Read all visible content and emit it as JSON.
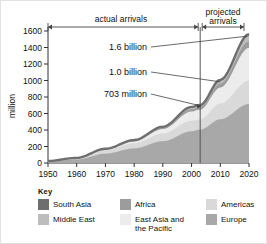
{
  "chart_data": {
    "type": "area",
    "title": "",
    "xlabel": "",
    "ylabel": "million",
    "xlim": [
      1950,
      2020
    ],
    "ylim": [
      0,
      1600
    ],
    "grid": false,
    "legend_position": "bottom",
    "xticks": [
      "1950",
      "1960",
      "1970",
      "1980",
      "1990",
      "2000",
      "2010",
      "2020"
    ],
    "yticks": [
      "0",
      "200",
      "400",
      "600",
      "800",
      "1000",
      "1200",
      "1400",
      "1600"
    ],
    "x": [
      1950,
      1960,
      1970,
      1980,
      1990,
      2000,
      2003,
      2010,
      2020
    ],
    "stacked": true,
    "series": [
      {
        "name": "Europe",
        "color": "#a8a8a8",
        "values": [
          17,
          42,
          113,
          178,
          264,
          385,
          405,
          530,
          717
        ]
      },
      {
        "name": "Americas",
        "color": "#d9d9d9",
        "values": [
          7,
          17,
          43,
          62,
          93,
          128,
          122,
          190,
          282
        ]
      },
      {
        "name": "East Asia and the Pacific",
        "color": "#ececec",
        "values": [
          0.2,
          1,
          6,
          21,
          55,
          111,
          120,
          195,
          397
        ]
      },
      {
        "name": "Africa",
        "color": "#9c9c9c",
        "values": [
          0.5,
          1,
          5,
          8,
          15,
          27,
          30,
          47,
          77
        ]
      },
      {
        "name": "Middle East",
        "color": "#bdbdbd",
        "values": [
          0.2,
          1,
          4,
          7,
          10,
          23,
          24,
          36,
          69
        ]
      },
      {
        "name": "South Asia",
        "color": "#6e6e6e",
        "values": [
          0.2,
          0.5,
          1,
          2,
          3,
          6,
          2,
          10,
          19
        ]
      }
    ],
    "totals": [
      25,
      62,
      172,
      278,
      440,
      680,
      703,
      1008,
      1561
    ],
    "annotations": [
      {
        "id": "a1",
        "label": "1.6 billion",
        "year": 2020,
        "value": 1561
      },
      {
        "id": "a2",
        "label": "1.0 billion",
        "year": 2010,
        "value": 1008
      },
      {
        "id": "a3",
        "label": "703 million",
        "year": 2003,
        "value": 703
      }
    ],
    "spans": [
      {
        "id": "s1",
        "label": "actual arrivals",
        "from": 1950,
        "to": 2003
      },
      {
        "id": "s2",
        "label": "projected arrivals",
        "from": 2003,
        "to": 2020
      }
    ],
    "divider_year": 2003
  },
  "legend": {
    "title": "Key",
    "items": [
      {
        "label": "South Asia",
        "color": "#6e6e6e"
      },
      {
        "label": "Africa",
        "color": "#9c9c9c"
      },
      {
        "label": "Americas",
        "color": "#d9d9d9"
      },
      {
        "label": "Middle East",
        "color": "#bdbdbd"
      },
      {
        "label": "East Asia and\nthe Pacific",
        "color": "#ececec"
      },
      {
        "label": "Europe",
        "color": "#a8a8a8"
      }
    ]
  }
}
